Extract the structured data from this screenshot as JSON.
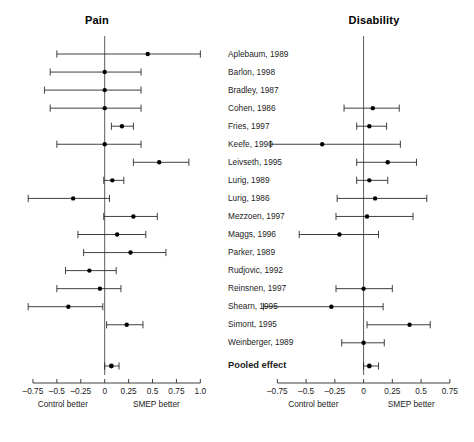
{
  "figure": {
    "panels": [
      {
        "key": "pain",
        "title": "Pain",
        "axis": {
          "min": -0.875,
          "max": 1.08,
          "ticks": [
            -0.75,
            -0.5,
            -0.25,
            0,
            0.25,
            0.5,
            0.75,
            1.0
          ],
          "tick_labels": [
            "–0.75",
            "–0.5",
            "–0.25",
            "0",
            "0.25",
            "0.5",
            "0.75",
            "1.0"
          ],
          "left_caption": "Control better",
          "right_caption": "SMEP better"
        }
      },
      {
        "key": "disability",
        "title": "Disability",
        "axis": {
          "min": -0.875,
          "max": 0.83,
          "ticks": [
            -0.75,
            -0.5,
            -0.25,
            0,
            0.25,
            0.5,
            0.75
          ],
          "tick_labels": [
            "–0.75",
            "–0.5",
            "–0.25",
            "0",
            "0.25",
            "0.5",
            "0.75"
          ],
          "left_caption": "Control better",
          "right_caption": "SMEP better"
        }
      }
    ]
  },
  "chart_data": {
    "type": "forest",
    "xlabel": "Effect size (Control better ← | → SMEP better)",
    "ylabel": "",
    "grid": false,
    "legend": "none",
    "null_line": 0,
    "study_labels": [
      "Aplebaum, 1989",
      "Barlon, 1998",
      "Bradley, 1987",
      "Cohen, 1986",
      "Fries, 1997",
      "Keefe, 1990",
      "Leivseth, 1995",
      "Lurig, 1989",
      "Lurig, 1986",
      "Mezzoen, 1997",
      "Maggs, 1996",
      "Parker, 1989",
      "Rudjovic, 1992",
      "Reinsnen, 1997",
      "Shearn, 1995",
      "Simont, 1995",
      "Weinberger, 1989"
    ],
    "pooled_label": "Pooled effect",
    "series": [
      {
        "name": "Pain",
        "xlim": [
          -0.875,
          1.08
        ],
        "rows": [
          {
            "study": "Aplebaum, 1989",
            "effect": 0.45,
            "ci_low": -0.5,
            "ci_high": 1.0
          },
          {
            "study": "Barlon, 1998",
            "effect": 0.0,
            "ci_low": -0.57,
            "ci_high": 0.38
          },
          {
            "study": "Bradley, 1987",
            "effect": 0.0,
            "ci_low": -0.63,
            "ci_high": 0.38
          },
          {
            "study": "Cohen, 1986",
            "effect": 0.0,
            "ci_low": -0.57,
            "ci_high": 0.38
          },
          {
            "study": "Fries, 1997",
            "effect": 0.18,
            "ci_low": 0.07,
            "ci_high": 0.3
          },
          {
            "study": "Keefe, 1990",
            "effect": 0.0,
            "ci_low": -0.5,
            "ci_high": 0.38
          },
          {
            "study": "Leivseth, 1995",
            "effect": 0.57,
            "ci_low": 0.3,
            "ci_high": 0.88
          },
          {
            "study": "Lurig, 1989",
            "effect": 0.08,
            "ci_low": -0.01,
            "ci_high": 0.2
          },
          {
            "study": "Lurig, 1986",
            "effect": -0.33,
            "ci_low": -0.8,
            "ci_high": 0.05
          },
          {
            "study": "Mezzoen, 1997",
            "effect": 0.3,
            "ci_low": -0.01,
            "ci_high": 0.55
          },
          {
            "study": "Maggs, 1996",
            "effect": 0.13,
            "ci_low": -0.28,
            "ci_high": 0.43
          },
          {
            "study": "Parker, 1989",
            "effect": 0.27,
            "ci_low": -0.22,
            "ci_high": 0.64
          },
          {
            "study": "Rudjovic, 1992",
            "effect": -0.16,
            "ci_low": -0.41,
            "ci_high": 0.12
          },
          {
            "study": "Reinsnen, 1997",
            "effect": -0.05,
            "ci_low": -0.5,
            "ci_high": 0.17
          },
          {
            "study": "Shearn, 1995",
            "effect": -0.38,
            "ci_low": -0.8,
            "ci_high": -0.02
          },
          {
            "study": "Simont, 1995",
            "effect": 0.23,
            "ci_low": 0.02,
            "ci_high": 0.4
          },
          {
            "study": "Weinberger, 1989",
            "effect": null,
            "ci_low": null,
            "ci_high": null
          }
        ],
        "pooled": {
          "effect": 0.07,
          "ci_low": 0.0,
          "ci_high": 0.15
        }
      },
      {
        "name": "Disability",
        "xlim": [
          -0.875,
          0.83
        ],
        "rows": [
          {
            "study": "Aplebaum, 1989",
            "effect": null,
            "ci_low": null,
            "ci_high": null
          },
          {
            "study": "Barlon, 1998",
            "effect": null,
            "ci_low": null,
            "ci_high": null
          },
          {
            "study": "Bradley, 1987",
            "effect": null,
            "ci_low": null,
            "ci_high": null
          },
          {
            "study": "Cohen, 1986",
            "effect": 0.08,
            "ci_low": -0.17,
            "ci_high": 0.31
          },
          {
            "study": "Fries, 1997",
            "effect": 0.05,
            "ci_low": -0.06,
            "ci_high": 0.2
          },
          {
            "study": "Keefe, 1990",
            "effect": -0.36,
            "ci_low": -0.81,
            "ci_high": 0.32
          },
          {
            "study": "Leivseth, 1995",
            "effect": 0.21,
            "ci_low": -0.06,
            "ci_high": 0.46
          },
          {
            "study": "Lurig, 1989",
            "effect": 0.05,
            "ci_low": -0.06,
            "ci_high": 0.21
          },
          {
            "study": "Lurig, 1986",
            "effect": 0.1,
            "ci_low": -0.23,
            "ci_high": 0.55
          },
          {
            "study": "Mezzoen, 1997",
            "effect": 0.03,
            "ci_low": -0.24,
            "ci_high": 0.43
          },
          {
            "study": "Maggs, 1996",
            "effect": -0.21,
            "ci_low": -0.56,
            "ci_high": 0.13
          },
          {
            "study": "Parker, 1989",
            "effect": null,
            "ci_low": null,
            "ci_high": null
          },
          {
            "study": "Rudjovic, 1992",
            "effect": null,
            "ci_low": null,
            "ci_high": null
          },
          {
            "study": "Reinsnen, 1997",
            "effect": 0.0,
            "ci_low": -0.24,
            "ci_high": 0.25
          },
          {
            "study": "Shearn, 1995",
            "effect": -0.28,
            "ci_low": -0.87,
            "ci_high": 0.17
          },
          {
            "study": "Simont, 1995",
            "effect": 0.4,
            "ci_low": 0.03,
            "ci_high": 0.58
          },
          {
            "study": "Weinberger, 1989",
            "effect": 0.0,
            "ci_low": -0.19,
            "ci_high": 0.18
          }
        ],
        "pooled": {
          "effect": 0.05,
          "ci_low": 0.0,
          "ci_high": 0.13
        }
      }
    ]
  }
}
